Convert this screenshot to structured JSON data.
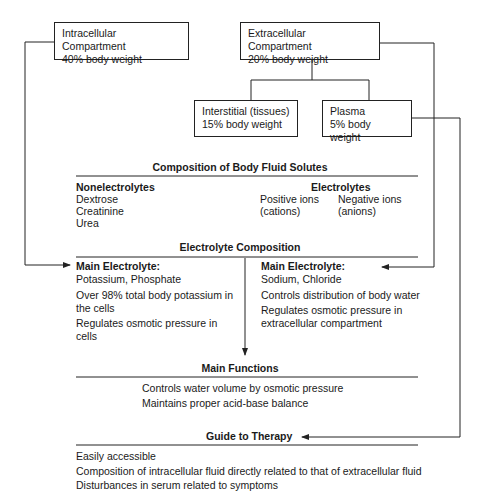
{
  "compartments": {
    "intracellular": {
      "title": "Intracellular Compartment",
      "subtitle": "40% body weight"
    },
    "extracellular": {
      "title": "Extracellular Compartment",
      "subtitle": "20% body weight"
    },
    "interstitial": {
      "title": "Interstitial (tissues)",
      "subtitle": "15% body weight"
    },
    "plasma": {
      "title": "Plasma",
      "subtitle": "5% body weight"
    }
  },
  "solutes": {
    "heading": "Composition of Body Fluid Solutes",
    "nonelectrolytes": {
      "title": "Nonelectrolytes",
      "items": [
        "Dextrose",
        "Creatinine",
        "Urea"
      ]
    },
    "electrolytes": {
      "title": "Electrolytes",
      "positive": {
        "line1": "Positive ions",
        "line2": "(cations)"
      },
      "negative": {
        "line1": "Negative ions",
        "line2": "(anions)"
      }
    }
  },
  "electrolyte_composition": {
    "heading": "Electrolyte Composition",
    "intracellular": {
      "title": "Main Electrolyte:",
      "value": "Potassium, Phosphate",
      "notes": [
        "Over 98% total body potassium in",
        "the cells",
        "Regulates osmotic pressure in",
        "cells"
      ]
    },
    "extracellular": {
      "title": "Main Electrolyte:",
      "value": "Sodium, Chloride",
      "notes": [
        "Controls distribution of body water",
        "Regulates osmotic pressure in",
        "extracellular compartment"
      ]
    }
  },
  "main_functions": {
    "heading": "Main Functions",
    "items": [
      "Controls water volume by osmotic pressure",
      "Maintains proper acid-base balance"
    ]
  },
  "guide_to_therapy": {
    "heading": "Guide to Therapy",
    "items": [
      "Easily accessible",
      "Composition of intracellular fluid directly related to that of extracellular fluid",
      "Disturbances in serum related to symptoms"
    ]
  },
  "colors": {
    "line": "#222222",
    "text": "#1a1a1a",
    "background": "#ffffff"
  }
}
